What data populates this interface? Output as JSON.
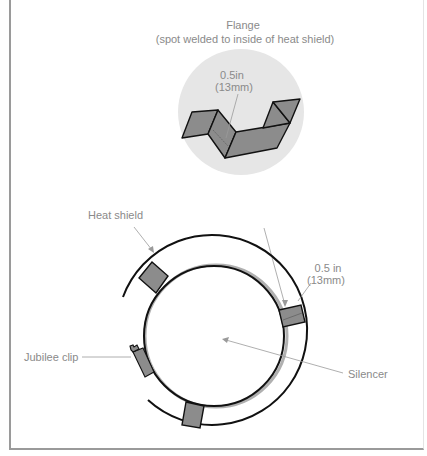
{
  "figure": {
    "flange_detail": {
      "title": "Flange",
      "subtitle": "(spot welded to inside of heat shield)",
      "dimension_line1": "0.5in",
      "dimension_line2": "(13mm)"
    },
    "assembly": {
      "heat_shield_label": "Heat shield",
      "dimension_line1": "0.5 in",
      "dimension_line2": "(13mm)",
      "jubilee_clip_label": "Jubilee clip",
      "silencer_label": "Silencer"
    },
    "colors": {
      "detail_background": "#e6e6e6",
      "flange_fill": "#8c8c8c",
      "outline": "#111111",
      "leader_line": "#9a9a9a",
      "label_text": "#8a8a8a",
      "silencer_shadow": "#b0b0b0"
    }
  }
}
